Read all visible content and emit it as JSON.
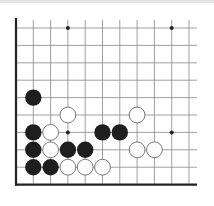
{
  "diagram": {
    "type": "go-board-fragment",
    "corner": "bottom-left",
    "grid": {
      "origin_x": 16,
      "origin_y": 28,
      "spacing_x": 17.3,
      "spacing_y": 17.4,
      "columns": 11,
      "rows": 10,
      "line_color": "#888888",
      "edge_color": "#222222"
    },
    "star_points": [
      {
        "col": 3,
        "row": 0
      },
      {
        "col": 9,
        "row": 0
      },
      {
        "col": 3,
        "row": 6
      },
      {
        "col": 9,
        "row": 6
      }
    ],
    "black_stones": [
      {
        "col": 1,
        "row": 4
      },
      {
        "col": 1,
        "row": 6
      },
      {
        "col": 5,
        "row": 6
      },
      {
        "col": 6,
        "row": 6
      },
      {
        "col": 1,
        "row": 7
      },
      {
        "col": 3,
        "row": 7
      },
      {
        "col": 4,
        "row": 7
      },
      {
        "col": 1,
        "row": 8
      },
      {
        "col": 2,
        "row": 8
      }
    ],
    "white_stones": [
      {
        "col": 3,
        "row": 5
      },
      {
        "col": 7,
        "row": 5
      },
      {
        "col": 2,
        "row": 6
      },
      {
        "col": 2,
        "row": 7
      },
      {
        "col": 7,
        "row": 7
      },
      {
        "col": 8,
        "row": 7
      },
      {
        "col": 3,
        "row": 8
      },
      {
        "col": 4,
        "row": 8
      },
      {
        "col": 5,
        "row": 8
      }
    ],
    "colors": {
      "black_stone": "#1e1e1e",
      "white_stone": "#ffffff",
      "white_stone_border": "#555555",
      "background": "#ffffff"
    }
  }
}
